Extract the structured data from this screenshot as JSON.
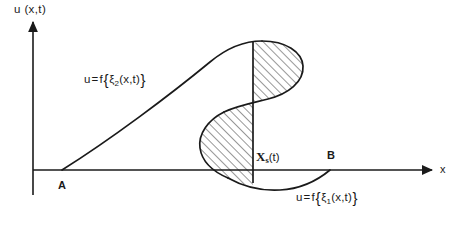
{
  "figure": {
    "kind": "wave-breaking-shock-diagram",
    "background_color": "#ffffff",
    "ink_color": "#1a1a1a",
    "width": 464,
    "height": 225
  },
  "axes": {
    "y_label": "u (x,t)",
    "x_label": "x",
    "origin": {
      "x": 33,
      "y": 170
    },
    "x_axis": {
      "start_x": 33,
      "end_x": 432,
      "y": 170,
      "arrow": "right"
    },
    "y_axis": {
      "x": 33,
      "top_y": 22,
      "bottom_y": 195,
      "arrow": "up"
    }
  },
  "points": [
    {
      "name": "A",
      "label": "A",
      "x": 62,
      "y": 170,
      "label_x": 58,
      "label_y": 180
    },
    {
      "name": "B",
      "label": "B",
      "x": 330,
      "y": 170,
      "label_x": 327,
      "label_y": 150
    }
  ],
  "shock": {
    "label_x": "X",
    "label_sub": "s",
    "label_arg": "(t)",
    "line_x": 253,
    "top_y": 42,
    "bottom_y": 183
  },
  "annotations": {
    "upper": {
      "lhs": "u",
      "eq": "=",
      "f": "f",
      "open": "{",
      "xi": "ξ",
      "sub": "2",
      "arg": "(x,t)",
      "close": "}"
    },
    "lower": {
      "lhs": "u",
      "eq": "=",
      "f": "f",
      "open": "{",
      "xi": "ξ",
      "sub": "1",
      "arg": "(x,t)",
      "close": "}"
    }
  },
  "curve": {
    "description": "Multivalued S-shaped profile: rises from A, peaks right of the shock line, folds back left, loops down past the axis and returns right to B.",
    "rising_branch": "M 62 170 C 110 140 170 95 210 62 C 228 47 244 41 262 41",
    "upper_fold": "M 262 41 C 286 41 302 52 303 66 C 304 82 288 94 268 99 C 252 103 236 106 224 112",
    "mid_descent": "M 224 112 C 208 120 198 134 200 148 C 202 162 214 172 228 178",
    "lower_return": "M 228 178 C 244 187 262 191 280 190 C 300 189 318 180 330 170",
    "tail": "M 330 170 L 332 169"
  },
  "hatched_regions": [
    {
      "name": "upper-lobe",
      "path": "M 253 43 L 262 41 C 286 41 302 52 303 66 C 304 82 288 94 268 99 C 262 100 257 101 253 102 Z"
    },
    {
      "name": "lower-lobe",
      "path": "M 253 102 C 240 106 230 109 224 112 C 208 120 198 134 200 148 C 202 162 214 172 228 178 C 236 182 245 185 253 186 Z"
    }
  ],
  "hatching": {
    "angle_degrees": 45,
    "spacing_px": 6,
    "stroke_color": "#1a1a1a",
    "stroke_width": 0.9
  }
}
